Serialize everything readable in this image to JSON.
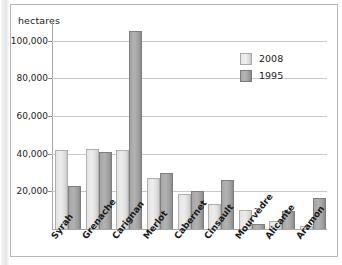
{
  "chart_data": {
    "type": "bar",
    "title": "",
    "subtitle": "",
    "xlabel": "",
    "ylabel": "hectares",
    "ylim": [
      0,
      110000
    ],
    "yticks": [
      20000,
      40000,
      60000,
      80000,
      100000
    ],
    "ytick_labels": [
      "20,000",
      "40,000",
      "60,000",
      "80,000",
      "100,000"
    ],
    "grid": true,
    "legend_position": "top-right",
    "categories": [
      "Syrah",
      "Grenache",
      "Carignan",
      "Merlot",
      "Cabernet",
      "Cinsault",
      "Mourvèdre",
      "Alicante",
      "Aramon"
    ],
    "series": [
      {
        "name": "2008",
        "color": "#e3e3e3",
        "values": [
          42000,
          42500,
          42000,
          27000,
          18500,
          13500,
          10000,
          4000,
          1500
        ]
      },
      {
        "name": "1995",
        "color": "#a5a5a5",
        "values": [
          23000,
          41000,
          105000,
          30000,
          20000,
          26000,
          2500,
          9500,
          16500
        ]
      }
    ]
  },
  "legend": {
    "items": [
      {
        "label": "2008"
      },
      {
        "label": "1995"
      }
    ]
  }
}
